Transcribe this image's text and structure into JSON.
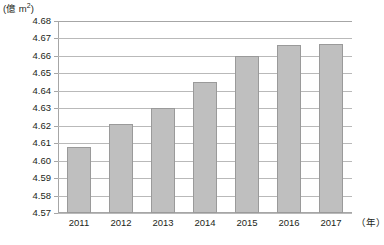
{
  "chart_data": {
    "type": "bar",
    "title": "",
    "subtitle": "",
    "xlabel": "(年)",
    "ylabel": "(億 m²)",
    "categories": [
      "2011",
      "2012",
      "2013",
      "2014",
      "2015",
      "2016",
      "2017"
    ],
    "values": [
      4.608,
      4.621,
      4.63,
      4.645,
      4.66,
      4.666,
      4.667
    ],
    "series": [
      {
        "name": "面積",
        "values": [
          4.608,
          4.621,
          4.63,
          4.645,
          4.66,
          4.666,
          4.667
        ]
      }
    ],
    "ylim": [
      4.57,
      4.68
    ],
    "ytick_step": 0.01,
    "ytick_labels": [
      "4.68",
      "4.67",
      "4.66",
      "4.65",
      "4.64",
      "4.63",
      "4.62",
      "4.61",
      "4.60",
      "4.59",
      "4.58",
      "4.57"
    ],
    "ytick_values": [
      4.68,
      4.67,
      4.66,
      4.65,
      4.64,
      4.63,
      4.62,
      4.61,
      4.6,
      4.59,
      4.58,
      4.57
    ],
    "grid": true,
    "legend": false,
    "legend_position": "none",
    "bar_color": "#bfbfbf",
    "bar_border_color": "#9a9a9a",
    "gridline_color": "#b9b9b9",
    "axis_color": "#a6a6a6",
    "text_color": "#231f20"
  },
  "axis": {
    "y_unit_open": "(",
    "y_unit_text": "億 m",
    "y_unit_sup": "2",
    "y_unit_close": ")",
    "x_unit": "（年）"
  }
}
